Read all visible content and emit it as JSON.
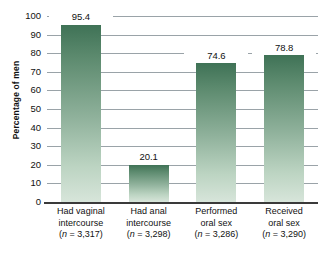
{
  "chart_data": {
    "type": "bar",
    "title": "",
    "subtitle": "",
    "xlabel": "",
    "ylabel": "Percentage of men",
    "ylim": [
      0,
      100
    ],
    "ytick_step": 10,
    "grid": true,
    "legend": false,
    "categories": [
      "Had vaginal intercourse",
      "Had anal intercourse",
      "Performed oral sex",
      "Received oral sex"
    ],
    "values": [
      95.4,
      20.1,
      74.6,
      78.8
    ],
    "sample_sizes": [
      3317,
      3298,
      3286,
      3290
    ],
    "bar_color_top": "#3f7256",
    "bar_color_bottom": "#d7e5da",
    "gridline_color": "#9aa3a8",
    "axis_color": "#3a3a3a"
  },
  "axis": {
    "y_title": "Percentage of men",
    "y_ticks": [
      "100",
      "90",
      "80",
      "70",
      "60",
      "50",
      "40",
      "30",
      "20",
      "10",
      "0"
    ]
  },
  "bars": [
    {
      "value_label": "95.4",
      "value": 95.4,
      "cat_line1": "Had vaginal",
      "cat_line2": "intercourse",
      "n_prefix": "(",
      "n_italic": "n",
      "n_suffix": " = 3,317)"
    },
    {
      "value_label": "20.1",
      "value": 20.1,
      "cat_line1": "Had anal",
      "cat_line2": "intercourse",
      "n_prefix": "(",
      "n_italic": "n",
      "n_suffix": " = 3,298)"
    },
    {
      "value_label": "74.6",
      "value": 74.6,
      "cat_line1": "Performed",
      "cat_line2": "oral sex",
      "n_prefix": "(",
      "n_italic": "n",
      "n_suffix": " = 3,286)"
    },
    {
      "value_label": "78.8",
      "value": 78.8,
      "cat_line1": "Received",
      "cat_line2": "oral sex",
      "n_prefix": "(",
      "n_italic": "n",
      "n_suffix": " = 3,290)"
    }
  ]
}
